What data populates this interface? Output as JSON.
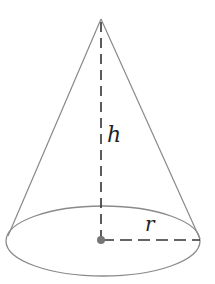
{
  "diagram": {
    "type": "cone",
    "labels": {
      "height": "h",
      "radius": "r"
    },
    "geometry": {
      "apex": [
        101,
        19
      ],
      "base_center": [
        101,
        241
      ],
      "base_rx": 96,
      "base_ry": 35
    },
    "colors": {
      "outline": "#8a8a8a",
      "dashed": "#333333",
      "center_dot": "#777777",
      "background": "#ffffff"
    }
  }
}
